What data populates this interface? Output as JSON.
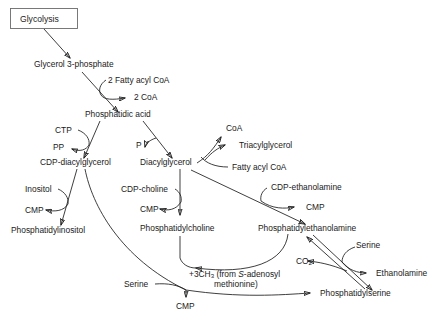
{
  "diagram": {
    "stroke_color": "#1c1c1c",
    "box_stroke_color": "#6a6a6a",
    "background_color": "#ffffff",
    "nodes": {
      "glycolysis": "Glycolysis",
      "glycerol_3_phosphate": "Glycerol 3-phosphate",
      "two_fatty_acyl_coa": "2 Fatty acyl CoA",
      "two_coa": "2 CoA",
      "phosphatidic_acid": "Phosphatidic acid",
      "ctp": "CTP",
      "pp": "PP",
      "pi": "P",
      "cdp_diacylglycerol": "CDP-diacylglycerol",
      "diacylglycerol": "Diacylglycerol",
      "coa": "CoA",
      "triacylglycerol": "Triacylglycerol",
      "fatty_acyl_coa": "Fatty acyl CoA",
      "inositol": "Inositol",
      "cmp_inositol": "CMP",
      "phosphatidylinositol": "Phosphatidylinositol",
      "cdp_choline": "CDP-choline",
      "cmp_choline": "CMP",
      "phosphatidylcholine": "Phosphatidylcholine",
      "cdp_ethanolamine": "CDP-ethanolamine",
      "cmp_ethanolamine": "CMP",
      "phosphatidylethanolamine": "Phosphatidylethanolamine",
      "methyl_donor_line1_prefix": "+",
      "methyl_donor_line1_a": "3CH",
      "methyl_donor_line1_sub": "3",
      "methyl_donor_line1_b": " (from ",
      "methyl_donor_line1_ital": "S",
      "methyl_donor_line1_c": "-adenosyl",
      "methyl_donor_line2": "methionine)",
      "serine_bottom": "Serine",
      "cmp_serine": "CMP",
      "phosphatidylserine": "Phosphatidylserine",
      "serine_right": "Serine",
      "co2_a": "CO",
      "co2_sub": "2",
      "ethanolamine": "Ethanolamine"
    }
  }
}
